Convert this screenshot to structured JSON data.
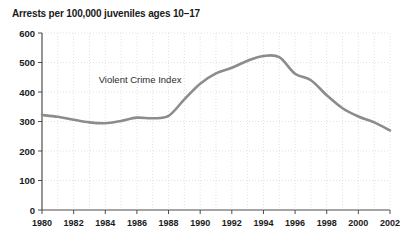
{
  "chart_data": {
    "type": "line",
    "title": "Arrests per 100,000 juveniles ages 10–17",
    "xlabel": "",
    "ylabel": "",
    "xlim": [
      1980,
      2002
    ],
    "ylim": [
      0,
      600
    ],
    "grid": true,
    "legend_position": "inline-annotation",
    "annotations": [
      {
        "text": "Violent Crime Index",
        "x": 1986.2,
        "y": 430
      }
    ],
    "ytick_labels": [
      "0",
      "100",
      "200",
      "300",
      "400",
      "500",
      "600"
    ],
    "yticks": [
      0,
      100,
      200,
      300,
      400,
      500,
      600
    ],
    "xtick_labels": [
      "1980",
      "1982",
      "1984",
      "1986",
      "1988",
      "1990",
      "1992",
      "1994",
      "1996",
      "1998",
      "2000",
      "2002"
    ],
    "xticks": [
      1980,
      1982,
      1984,
      1986,
      1988,
      1990,
      1992,
      1994,
      1996,
      1998,
      2000,
      2002
    ],
    "x": [
      1980,
      1981,
      1982,
      1983,
      1984,
      1985,
      1986,
      1987,
      1988,
      1989,
      1990,
      1991,
      1992,
      1993,
      1994,
      1995,
      1996,
      1997,
      1998,
      1999,
      2000,
      2001,
      2002
    ],
    "series": [
      {
        "name": "Violent Crime Index",
        "color": "#8c8c8c",
        "values": [
          322,
          316,
          306,
          297,
          294,
          302,
          313,
          311,
          319,
          375,
          428,
          463,
          482,
          506,
          522,
          518,
          462,
          440,
          389,
          345,
          317,
          297,
          270
        ]
      }
    ]
  }
}
